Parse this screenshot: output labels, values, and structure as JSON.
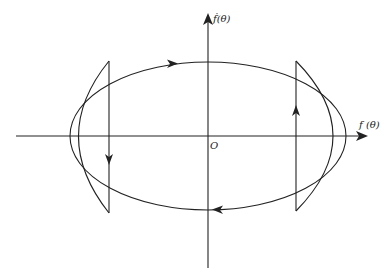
{
  "diagram": {
    "type": "phase-portrait",
    "axes": {
      "x_label": "f (θ)",
      "y_label": "ḟ(θ)",
      "origin_label": "O"
    },
    "elements": [
      {
        "name": "ellipse-trajectory",
        "direction": "clockwise"
      },
      {
        "name": "left-lens-region",
        "arrow": "down"
      },
      {
        "name": "right-lens-region",
        "arrow": "up"
      }
    ],
    "colors": {
      "stroke": "#222222",
      "background": "#ffffff"
    }
  }
}
